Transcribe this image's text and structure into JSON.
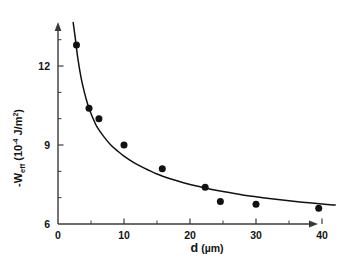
{
  "chart_data": {
    "type": "scatter",
    "title": "",
    "xlabel": "d (µm)",
    "ylabel": "-W_eff (10⁻⁴ J/m²)",
    "xlim": [
      0,
      43
    ],
    "ylim": [
      6,
      13.8
    ],
    "grid": false,
    "legend": null,
    "x_ticks": [
      0,
      10,
      20,
      30,
      40
    ],
    "x_tick_labels": [
      "0",
      "10",
      "20",
      "30",
      "40"
    ],
    "x_minor_ticks": [
      5,
      15,
      25,
      35
    ],
    "y_ticks": [
      6,
      9,
      12
    ],
    "y_tick_labels": [
      "6",
      "9",
      "12"
    ],
    "y_minor_ticks": [
      7,
      8,
      10,
      11,
      13
    ],
    "x": [
      2.8,
      4.7,
      6.2,
      10.0,
      15.8,
      22.3,
      24.6,
      30.0,
      39.5
    ],
    "y": [
      12.8,
      10.4,
      10.0,
      9.0,
      8.1,
      7.4,
      6.85,
      6.75,
      6.6
    ],
    "points": [
      {
        "x": 2.8,
        "y": 12.8
      },
      {
        "x": 4.7,
        "y": 10.4
      },
      {
        "x": 6.2,
        "y": 10.0
      },
      {
        "x": 10.0,
        "y": 9.0
      },
      {
        "x": 15.8,
        "y": 8.1
      },
      {
        "x": 22.3,
        "y": 7.4
      },
      {
        "x": 24.6,
        "y": 6.85
      },
      {
        "x": 30.0,
        "y": 6.75
      },
      {
        "x": 39.5,
        "y": 6.6
      }
    ],
    "fit_curve": {
      "name": "fitted-decay-curve",
      "x": [
        2.3,
        2.6,
        3.0,
        3.5,
        4.0,
        4.5,
        5.0,
        5.5,
        6.0,
        7.0,
        8.0,
        9.0,
        10.0,
        11.5,
        13.0,
        15.0,
        17.0,
        19.0,
        21.0,
        23.0,
        25.0,
        28.0,
        31.0,
        34.0,
        37.0,
        40.0,
        42.0
      ],
      "y": [
        13.65,
        13.1,
        12.3,
        11.55,
        11.0,
        10.55,
        10.2,
        9.9,
        9.65,
        9.3,
        9.0,
        8.78,
        8.58,
        8.33,
        8.13,
        7.9,
        7.72,
        7.57,
        7.44,
        7.33,
        7.23,
        7.1,
        7.0,
        6.91,
        6.83,
        6.76,
        6.72
      ]
    },
    "marker": {
      "shape": "circle",
      "color": "#111111",
      "size": 7
    },
    "line_color": "#111111",
    "axis_color": "#3a3a3a"
  },
  "labels": {
    "y_axis_prefix": "-W",
    "y_axis_sub": "eff",
    "y_axis_unit_open": " (10",
    "y_axis_unit_exp": "-4",
    "y_axis_unit_rest": " J/m",
    "y_axis_unit_sq": "2",
    "y_axis_unit_close": ")",
    "x_axis_var": "d",
    "x_axis_unit": "(µm)"
  }
}
